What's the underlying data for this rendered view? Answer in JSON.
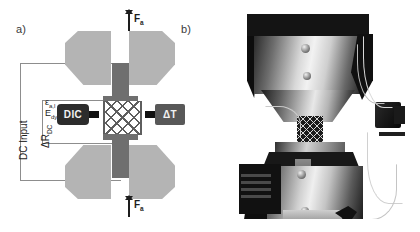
{
  "figure": {
    "type": "two-panel scientific figure",
    "background": "#ffffff"
  },
  "panels": [
    {
      "id": "a",
      "label": "a)",
      "kind": "schematic"
    },
    {
      "id": "b",
      "label": "b)",
      "kind": "photograph"
    }
  ],
  "schematic": {
    "forces": [
      {
        "id": "top",
        "label": "F",
        "subscript": "a",
        "direction": "double-headed-vertical"
      },
      {
        "id": "bottom",
        "label": "F",
        "subscript": "a",
        "direction": "double-headed-vertical"
      }
    ],
    "instruments": [
      {
        "id": "dic",
        "label": "DIC",
        "box_color": "#2c2c2c",
        "text_color": "#f2f2f2"
      },
      {
        "id": "delta-t",
        "label": "ΔT",
        "box_color": "#585858",
        "text_color": "#f2f2f2"
      }
    ],
    "circuit": {
      "outer_label": "DC Input",
      "inner_label_delta": "ΔR",
      "inner_label_sub": "DC",
      "wire_color": "#8d8d8d"
    },
    "measurements": [
      {
        "symbol": "ε",
        "subscript": "a,l"
      },
      {
        "symbol": "E",
        "subscript": "dyn"
      }
    ],
    "specimen": {
      "description": "lattice cross-hatch specimen",
      "cap_color": "#6f6f6f",
      "lattice_color": "#5e5e5e"
    },
    "grips": {
      "count": 4,
      "color": "#b4b4b4",
      "rod_color": "#6f6f6f"
    }
  },
  "photograph": {
    "description": "grayscale photo of servo-hydraulic test rig with upper and lower grips holding a lattice specimen, thermal sensor at right and cabling",
    "components": [
      "upper-grip-assembly",
      "lower-grip-assembly",
      "lattice-specimen",
      "thermal-sensor",
      "cabling",
      "manufacturer-sticker"
    ]
  },
  "colors": {
    "light_gray": "#b4b4b4",
    "mid_gray": "#6f6f6f",
    "dark": "#2c2c2c",
    "wire": "#8d8d8d",
    "text": "#1d1d1d"
  }
}
